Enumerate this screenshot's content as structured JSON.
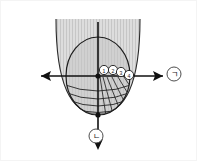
{
  "figure": {
    "title": "Parabola and inscribed ellipse coordinate diagram",
    "background_color": "#ffffff",
    "border_color": "#f2f2f2",
    "width": 197,
    "height": 161
  },
  "colors": {
    "stroke": "#1a1a1a",
    "parabola_fill": "#d6d6d6",
    "ellipse_fill": "#c8c8c8",
    "stripe": "#c2c2c2",
    "mesh": "#2b2b2b",
    "marker_fill": "#ffffff",
    "label_text": "#1a1a1a"
  },
  "axes": {
    "origin_label": "",
    "horizontal": {
      "name": "x-axis",
      "left_arrow": true,
      "right_arrow": true,
      "y": 76,
      "x_start": 41,
      "x_end": 163
    },
    "vertical": {
      "name": "y-axis",
      "down_arrow": true,
      "x": 98,
      "y_start": 22,
      "y_end": 145
    }
  },
  "points": [
    {
      "name": "origin-point",
      "x": 98,
      "y": 76
    },
    {
      "name": "lower-vertex-point",
      "x": 98,
      "y": 115
    }
  ],
  "markers": [
    {
      "label": "1",
      "x": 104,
      "y": 70,
      "r": 4.6
    },
    {
      "label": "2",
      "x": 113,
      "y": 70,
      "r": 4.6
    },
    {
      "label": "3",
      "x": 121,
      "y": 72,
      "r": 4.6
    },
    {
      "label": "4",
      "x": 129,
      "y": 75,
      "r": 4.6
    }
  ],
  "labels": {
    "right": {
      "text": "ㄱ",
      "name": "label-giyeok",
      "x": 174,
      "y": 74,
      "r": 7
    },
    "bottom": {
      "text": "ㄴ",
      "name": "label-nieun",
      "x": 96,
      "y": 136,
      "r": 7
    }
  },
  "shapes": {
    "parabola": {
      "name": "parabola-region",
      "vertex_x": 98,
      "vertex_y": 114,
      "top_y": 19,
      "left_top_x": 56,
      "right_top_x": 140
    },
    "ellipse": {
      "name": "inscribed-ellipse",
      "cx": 98,
      "cy": 76,
      "rx": 32,
      "ry": 39
    }
  },
  "mesh": {
    "name": "lower-mesh-grid",
    "arc_count": 4,
    "radial_count": 6,
    "description": "curved arcs across lower ellipse with radial lines on the right half"
  }
}
